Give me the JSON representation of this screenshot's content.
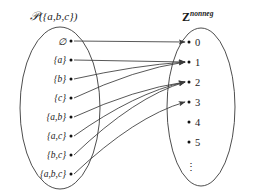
{
  "figure": {
    "type": "set-mapping-diagram",
    "background_color": "#ffffff",
    "stroke_color": "#3a3a3a",
    "dot_color": "#111111"
  },
  "domain_set": {
    "caption_prefix": "P",
    "caption_suffix": "({a,b,c})",
    "caption_full": "P({a,b,c})",
    "ellipse": {
      "cx": 60,
      "cy": 108,
      "rx": 40,
      "ry": 81
    },
    "items": [
      {
        "label": "∅",
        "dot_x": 71,
        "dot_y": 41
      },
      {
        "label": "{a}",
        "dot_x": 71,
        "dot_y": 60
      },
      {
        "label": "{b}",
        "dot_x": 71,
        "dot_y": 79
      },
      {
        "label": "{c}",
        "dot_x": 71,
        "dot_y": 98
      },
      {
        "label": "{a,b}",
        "dot_x": 71,
        "dot_y": 117
      },
      {
        "label": "{a,c}",
        "dot_x": 71,
        "dot_y": 136
      },
      {
        "label": "{b,c}",
        "dot_x": 71,
        "dot_y": 155
      },
      {
        "label": "{a,b,c}",
        "dot_x": 71,
        "dot_y": 174
      }
    ]
  },
  "codomain_set": {
    "caption_base": "Z",
    "caption_superscript": "nonneg",
    "caption_full": "Z^nonneg",
    "ellipse": {
      "cx": 201,
      "cy": 107,
      "rx": 34,
      "ry": 79
    },
    "items": [
      {
        "label": "0",
        "dot_x": 189,
        "dot_y": 42
      },
      {
        "label": "1",
        "dot_x": 189,
        "dot_y": 62
      },
      {
        "label": "2",
        "dot_x": 189,
        "dot_y": 82
      },
      {
        "label": "3",
        "dot_x": 189,
        "dot_y": 102
      },
      {
        "label": "4",
        "dot_x": 189,
        "dot_y": 122
      },
      {
        "label": "5",
        "dot_x": 189,
        "dot_y": 142
      }
    ],
    "ellipsis": {
      "glyph": "⋮",
      "x": 189,
      "y": 167
    }
  },
  "mappings": [
    {
      "from": "∅",
      "to": "0",
      "from_x": 74,
      "from_y": 41,
      "to_x": 185,
      "to_y": 42
    },
    {
      "from": "{a}",
      "to": "1",
      "from_x": 74,
      "from_y": 60,
      "to_x": 185,
      "to_y": 62
    },
    {
      "from": "{b}",
      "to": "1",
      "from_x": 74,
      "from_y": 79,
      "to_x": 185,
      "to_y": 62
    },
    {
      "from": "{c}",
      "to": "1",
      "from_x": 74,
      "from_y": 98,
      "to_x": 185,
      "to_y": 62
    },
    {
      "from": "{a,b}",
      "to": "2",
      "from_x": 74,
      "from_y": 117,
      "to_x": 185,
      "to_y": 82
    },
    {
      "from": "{a,c}",
      "to": "2",
      "from_x": 74,
      "from_y": 136,
      "to_x": 185,
      "to_y": 82
    },
    {
      "from": "{b,c}",
      "to": "2",
      "from_x": 74,
      "from_y": 155,
      "to_x": 185,
      "to_y": 82
    },
    {
      "from": "{a,b,c}",
      "to": "3",
      "from_x": 74,
      "from_y": 174,
      "to_x": 185,
      "to_y": 102
    }
  ]
}
